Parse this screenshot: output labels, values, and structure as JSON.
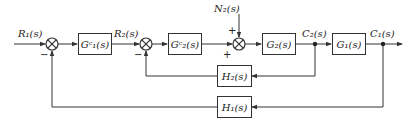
{
  "diagram": {
    "type": "control-system-block-diagram",
    "signals": {
      "r1": "R₁(s)",
      "r2": "R₂(s)",
      "n2": "N₂(s)",
      "c2": "C₂(s)",
      "c1": "C₁(s)"
    },
    "blocks": {
      "gc1": "Gᶜ₁(s)",
      "gc2": "Gᶜ₂(s)",
      "g2": "G₂(s)",
      "g1": "G₁(s)",
      "h2": "H₂(s)",
      "h1": "H₁(s)"
    },
    "signs": {
      "sum1_feedback": "−",
      "sum2_feedback": "−",
      "sum3_disturbance": "+",
      "sum3_forward": "+"
    },
    "colors": {
      "line": "#333333",
      "text": "#222222",
      "background": "#ffffff"
    }
  }
}
